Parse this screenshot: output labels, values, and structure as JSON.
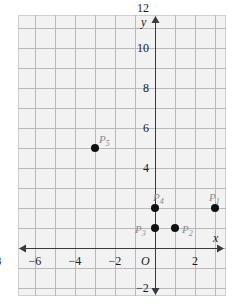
{
  "figure": {
    "kind": "coordinate-plane",
    "background": "#f2f2f2",
    "grid_color": "#b9b9b9",
    "axis_color": "#3a3a3a",
    "point_color": "#111111",
    "label_color": "#8a8a8a"
  },
  "axes": {
    "x_label": "x",
    "y_label": "y",
    "origin_label": "O",
    "x_ticks": [
      {
        "value": -8,
        "text": "−8"
      },
      {
        "value": -6,
        "text": "−6"
      },
      {
        "value": -4,
        "text": "−4"
      },
      {
        "value": -2,
        "text": "−2"
      },
      {
        "value": 2,
        "text": "2"
      }
    ],
    "y_ticks": [
      {
        "value": 12,
        "text": "12"
      },
      {
        "value": 10,
        "text": "10"
      },
      {
        "value": 8,
        "text": "8"
      },
      {
        "value": 6,
        "text": "6"
      },
      {
        "value": 4,
        "text": "4"
      },
      {
        "value": -2,
        "text": "−2"
      }
    ],
    "x_range": [
      -9,
      4
    ],
    "y_range": [
      -3,
      14
    ],
    "unit_px": 20,
    "grid": true
  },
  "chart_data": {
    "type": "scatter",
    "title": "",
    "xlabel": "x",
    "ylabel": "y",
    "xlim": [
      -9,
      4
    ],
    "ylim": [
      -3,
      14
    ],
    "grid": true,
    "legend": "none",
    "points": [
      {
        "name": "P1",
        "label": "P",
        "sub": "1",
        "x": 3,
        "y": 2,
        "label_dx": -6,
        "label_dy": -16
      },
      {
        "name": "P2",
        "label": "P",
        "sub": "2",
        "x": 1,
        "y": 1,
        "label_dx": 7,
        "label_dy": -4
      },
      {
        "name": "P3",
        "label": "P",
        "sub": "3",
        "x": 0,
        "y": 1,
        "label_dx": -20,
        "label_dy": -4
      },
      {
        "name": "P4",
        "label": "P",
        "sub": "4",
        "x": 0,
        "y": 2,
        "label_dx": -2,
        "label_dy": -16
      },
      {
        "name": "P5",
        "label": "P",
        "sub": "5",
        "x": -3,
        "y": 5,
        "label_dx": 4,
        "label_dy": -14
      },
      {
        "name": "P6",
        "label": "P",
        "sub": "6",
        "x": -8,
        "y": 13,
        "label_dx": 4,
        "label_dy": -14
      }
    ]
  }
}
